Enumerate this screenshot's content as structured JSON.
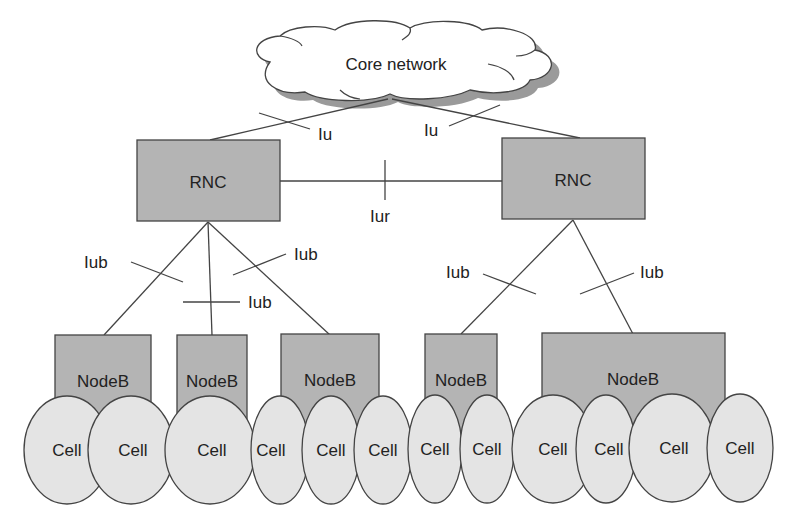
{
  "diagram": {
    "colors": {
      "box_fill": "#b4b4b4",
      "cell_fill": "#e4e4e4",
      "stroke": "#444444",
      "cloud_shadow": "#999999",
      "background": "#ffffff"
    },
    "core_network": {
      "label": "Core network"
    },
    "interfaces": {
      "iu_left": "Iu",
      "iu_right": "Iu",
      "iur": "Iur",
      "iub_1": "Iub",
      "iub_2": "Iub",
      "iub_3": "Iub",
      "iub_4": "Iub",
      "iub_5": "Iub"
    },
    "rncs": [
      {
        "label": "RNC"
      },
      {
        "label": "RNC"
      }
    ],
    "nodebs": [
      {
        "label": "NodeB"
      },
      {
        "label": "NodeB"
      },
      {
        "label": "NodeB"
      },
      {
        "label": "NodeB"
      },
      {
        "label": "NodeB"
      }
    ],
    "cells": [
      {
        "label": "Cell"
      },
      {
        "label": "Cell"
      },
      {
        "label": "Cell"
      },
      {
        "label": "Cell"
      },
      {
        "label": "Cell"
      },
      {
        "label": "Cell"
      },
      {
        "label": "Cell"
      },
      {
        "label": "Cell"
      },
      {
        "label": "Cell"
      },
      {
        "label": "Cell"
      },
      {
        "label": "Cell"
      },
      {
        "label": "Cell"
      }
    ]
  }
}
